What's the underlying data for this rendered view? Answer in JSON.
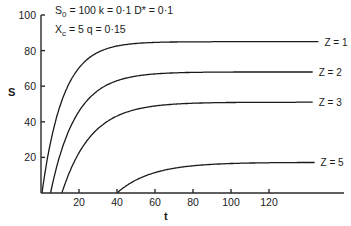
{
  "chart_data": {
    "type": "line",
    "title": "",
    "xlabel": "t",
    "ylabel": "S",
    "xlim": [
      0,
      160
    ],
    "ylim": [
      0,
      100
    ],
    "x_ticks": [
      20,
      40,
      60,
      80,
      100,
      120
    ],
    "y_ticks": [
      20,
      40,
      60,
      80,
      100
    ],
    "grid": false,
    "legend": "inline labels at right end of each curve",
    "annotations": [
      {
        "text_parts": [
          "S",
          "0",
          " = 100  k = 0·1  D* = 0·1"
        ]
      },
      {
        "text_parts": [
          "X",
          "c",
          " = 5  q = 0·15"
        ]
      }
    ],
    "parameters": {
      "S0": 100,
      "k": 0.1,
      "D*": 0.1,
      "Xc": 5,
      "q": 0.15
    },
    "series": [
      {
        "name": "Z = 1",
        "t_start": 0.5,
        "asymptote": 85,
        "rate": 0.09,
        "t_end": 146,
        "points": [
          [
            0.5,
            0
          ],
          [
            5,
            45
          ],
          [
            10,
            65
          ],
          [
            20,
            77
          ],
          [
            30,
            81
          ],
          [
            40,
            83
          ],
          [
            60,
            84
          ],
          [
            100,
            85
          ],
          [
            146,
            85
          ]
        ]
      },
      {
        "name": "Z = 2",
        "t_start": 5,
        "asymptote": 68,
        "rate": 0.075,
        "t_end": 143,
        "points": [
          [
            5,
            0
          ],
          [
            10,
            25
          ],
          [
            20,
            50
          ],
          [
            30,
            60
          ],
          [
            40,
            64
          ],
          [
            60,
            67
          ],
          [
            100,
            68
          ],
          [
            143,
            68
          ]
        ]
      },
      {
        "name": "Z = 3",
        "t_start": 11,
        "asymptote": 51,
        "rate": 0.065,
        "t_end": 143,
        "points": [
          [
            11,
            0
          ],
          [
            20,
            22
          ],
          [
            30,
            36
          ],
          [
            40,
            43
          ],
          [
            60,
            48
          ],
          [
            80,
            50
          ],
          [
            100,
            51
          ],
          [
            143,
            51
          ]
        ]
      },
      {
        "name": "Z = 5",
        "t_start": 40,
        "asymptote": 17.2,
        "rate": 0.055,
        "t_end": 144,
        "points": [
          [
            40,
            0
          ],
          [
            50,
            7
          ],
          [
            60,
            11.5
          ],
          [
            80,
            15.5
          ],
          [
            100,
            16.8
          ],
          [
            144,
            17.2
          ]
        ]
      }
    ]
  }
}
